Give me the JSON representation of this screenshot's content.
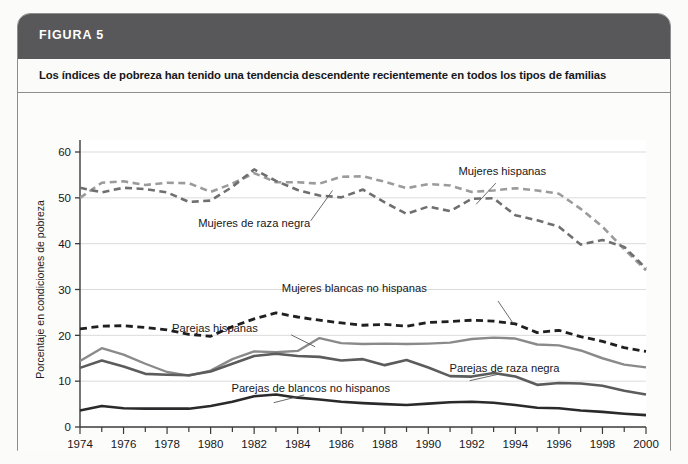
{
  "figure": {
    "header_label": "FIGURA 5",
    "subtitle": "Los índices de pobreza han tenido una tendencia descendente recientemente en todos los tipos de familias",
    "header_bg": "#58585a",
    "card_bg": "#fdfdfc",
    "border_color": "#8e8e8e"
  },
  "chart_data": {
    "type": "line",
    "title": "Los índices de pobreza han tenido una tendencia descendente recientemente en todos los tipos de familias",
    "xlabel": "",
    "ylabel": "Porcentaje en condiciones de pobreza",
    "xlim": [
      1974,
      2000
    ],
    "ylim": [
      0,
      60
    ],
    "grid": true,
    "legend_position": "inline-annotations",
    "x": [
      1974,
      1975,
      1976,
      1977,
      1978,
      1979,
      1980,
      1981,
      1982,
      1983,
      1984,
      1985,
      1986,
      1987,
      1988,
      1989,
      1990,
      1991,
      1992,
      1993,
      1994,
      1995,
      1996,
      1997,
      1998,
      1999,
      2000
    ],
    "ytick_labels": [
      "0",
      "10",
      "20",
      "30",
      "40",
      "50",
      "60"
    ],
    "yticks": [
      0,
      10,
      20,
      30,
      40,
      50,
      60
    ],
    "xtick_labels": [
      "1974",
      "1976",
      "1978",
      "1980",
      "1982",
      "1984",
      "1986",
      "1988",
      "1990",
      "1992",
      "1994",
      "1996",
      "1998",
      "2000"
    ],
    "xticks": [
      1974,
      1976,
      1978,
      1980,
      1982,
      1984,
      1986,
      1988,
      1990,
      1992,
      1994,
      1996,
      1998,
      2000
    ],
    "series": [
      {
        "name": "Mujeres hispanas",
        "color": "#9b9b9b",
        "style": "dashed",
        "width": 2.6,
        "label_x": 1993.4,
        "label_y": 55.0,
        "leader_from": [
          1993.1,
          53.2
        ],
        "leader_to": [
          1992.2,
          48.6
        ],
        "values": [
          50.0,
          53.3,
          53.6,
          52.8,
          53.3,
          53.2,
          51.3,
          53.1,
          55.4,
          53.4,
          53.4,
          53.1,
          54.6,
          54.7,
          53.5,
          52.1,
          53.0,
          52.7,
          51.3,
          51.6,
          52.1,
          51.6,
          50.9,
          47.6,
          43.7,
          38.8,
          34.2
        ]
      },
      {
        "name": "Mujeres de raza negra",
        "color": "#6f6f70",
        "style": "dashed",
        "width": 2.6,
        "label_x": 1982.0,
        "label_y": 43.6,
        "leader_from": [
          1984.6,
          45.0
        ],
        "leader_to": [
          1985.6,
          51.6
        ],
        "values": [
          52.2,
          51.2,
          52.2,
          51.9,
          51.2,
          49.1,
          49.4,
          52.4,
          56.2,
          53.7,
          51.7,
          50.5,
          50.1,
          51.8,
          49.0,
          46.5,
          48.1,
          47.1,
          49.8,
          49.9,
          46.2,
          45.1,
          43.7,
          39.8,
          40.8,
          39.3,
          34.6
        ]
      },
      {
        "name": "Mujeres blancas no hispanas",
        "color": "#1f1f21",
        "style": "dashed",
        "width": 2.8,
        "label_x": 1986.6,
        "label_y": 29.4,
        "leader_from": [
          1993.2,
          27.5
        ],
        "leader_to": [
          1993.9,
          22.6
        ],
        "values": [
          21.4,
          22.0,
          22.1,
          21.7,
          21.2,
          20.2,
          19.8,
          21.9,
          23.6,
          24.9,
          24.0,
          23.3,
          22.7,
          22.2,
          22.4,
          22.0,
          22.8,
          23.0,
          23.3,
          23.1,
          22.5,
          20.6,
          21.1,
          19.7,
          18.7,
          17.3,
          16.5
        ]
      },
      {
        "name": "Parejas hispanas",
        "color": "#8a8a8a",
        "style": "solid",
        "width": 2.4,
        "label_x": 1980.2,
        "label_y": 20.8,
        "leader_from": [
          1983.7,
          20.1
        ],
        "leader_to": [
          1984.8,
          17.5
        ],
        "values": [
          14.4,
          17.2,
          15.8,
          13.8,
          12.0,
          11.2,
          12.3,
          14.8,
          16.5,
          16.3,
          16.6,
          19.4,
          18.3,
          18.1,
          18.2,
          18.1,
          18.2,
          18.4,
          19.2,
          19.5,
          19.3,
          18.0,
          17.8,
          16.7,
          15.0,
          13.6,
          13.0
        ]
      },
      {
        "name": "Parejas de raza negra",
        "color": "#5c5c5d",
        "style": "solid",
        "width": 2.6,
        "label_x": 1993.5,
        "label_y": 12.1,
        "leader_from": [
          1993.3,
          11.6
        ],
        "leader_to": [
          1991.9,
          10.1
        ],
        "values": [
          12.9,
          14.5,
          13.2,
          11.6,
          11.4,
          11.3,
          12.1,
          13.8,
          15.5,
          16.0,
          15.5,
          15.3,
          14.5,
          14.8,
          13.5,
          14.6,
          13.0,
          11.1,
          11.0,
          11.8,
          11.0,
          9.2,
          9.6,
          9.5,
          9.0,
          7.9,
          7.1
        ]
      },
      {
        "name": "Parejas de blancos no hispanos",
        "color": "#2a2a2c",
        "style": "solid",
        "width": 2.6,
        "label_x": 1984.6,
        "label_y": 7.7,
        "leader_from": [
          1984.3,
          7.0
        ],
        "leader_to": [
          1982.9,
          5.3
        ],
        "values": [
          3.6,
          4.6,
          4.1,
          4.0,
          4.0,
          4.0,
          4.6,
          5.5,
          6.7,
          7.1,
          6.4,
          6.0,
          5.5,
          5.2,
          5.0,
          4.8,
          5.1,
          5.4,
          5.5,
          5.3,
          4.8,
          4.2,
          4.1,
          3.6,
          3.3,
          2.9,
          2.6
        ]
      }
    ]
  }
}
